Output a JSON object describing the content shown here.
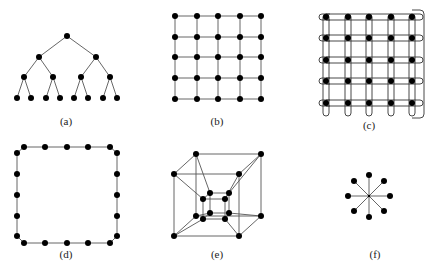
{
  "figure": {
    "panels": [
      {
        "id": "a",
        "label": "(a)",
        "topology": "binary-tree",
        "levels": 4,
        "node_count": 15
      },
      {
        "id": "b",
        "label": "(b)",
        "topology": "2d-mesh",
        "rows": 5,
        "cols": 5,
        "node_count": 25
      },
      {
        "id": "c",
        "label": "(c)",
        "topology": "2d-torus",
        "rows": 5,
        "cols": 5,
        "node_count": 25
      },
      {
        "id": "d",
        "label": "(d)",
        "topology": "ring",
        "node_count": 16
      },
      {
        "id": "e",
        "label": "(e)",
        "topology": "4d-hypercube",
        "node_count": 16
      },
      {
        "id": "f",
        "label": "(f)",
        "topology": "star",
        "node_count": 9
      }
    ]
  },
  "colors": {
    "node": "#000000",
    "edge": "#555555",
    "background": "#ffffff"
  }
}
